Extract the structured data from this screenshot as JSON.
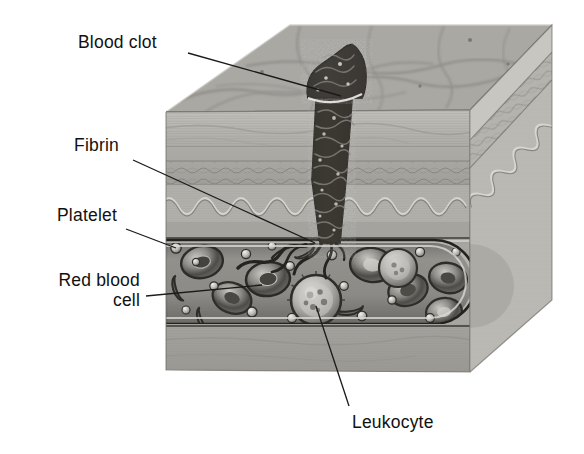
{
  "figure": {
    "type": "anatomical-illustration",
    "style": "grayscale halftone engraving",
    "background_color": "#ffffff"
  },
  "labels": {
    "blood_clot": "Blood clot",
    "fibrin": "Fibrin",
    "platelet": "Platelet",
    "red_blood_cell_line1": "Red blood",
    "red_blood_cell_line2": "cell",
    "leukocyte": "Leukocyte"
  },
  "colors": {
    "text": "#111111",
    "leader_line": "#1a1a1a",
    "skin_top": "#a9a7a2",
    "epidermis": "#b9b7b2",
    "dermis": "#a3a19c",
    "hypodermis": "#9b9995",
    "vessel_lumen": "#8c8a86",
    "clot_dark": "#3a3836",
    "block_right_face": "#bfbdb8"
  },
  "structures": [
    {
      "name": "skin-top-surface",
      "description": "mottled epidermal surface, top face of cut block"
    },
    {
      "name": "epidermis-layer",
      "description": "pale banded layer below surface"
    },
    {
      "name": "dermis-layer",
      "description": "layer with scalloped wavy papillae boundary"
    },
    {
      "name": "hypodermis-layer",
      "description": "lower subcutaneous layer"
    },
    {
      "name": "blood-clot-plug",
      "description": "dark tapered clot column with scab cap rising above skin"
    },
    {
      "name": "blood-vessel",
      "description": "horizontal capillary with rounded end cap on right"
    },
    {
      "name": "fibrin-mesh",
      "description": "dark squiggly fibrin strands at vessel breach"
    },
    {
      "name": "red-blood-cells",
      "description": "biconcave donut discs in lumen"
    },
    {
      "name": "platelets",
      "description": "small bright spheres in lumen"
    },
    {
      "name": "leukocyte",
      "description": "large spiky granular white cell in lumen"
    }
  ],
  "leaders": [
    {
      "name": "leader-blood-clot",
      "from": [
        188,
        53
      ],
      "to": [
        341,
        96
      ]
    },
    {
      "name": "leader-fibrin",
      "from": [
        133,
        160
      ],
      "to": [
        315,
        243
      ]
    },
    {
      "name": "leader-platelet",
      "from": [
        126,
        229
      ],
      "to": [
        176,
        248
      ]
    },
    {
      "name": "leader-rbc",
      "from": [
        146,
        296
      ],
      "to": [
        262,
        285
      ]
    },
    {
      "name": "leader-leukocyte",
      "from": [
        316,
        306
      ],
      "to": [
        349,
        406
      ]
    }
  ]
}
